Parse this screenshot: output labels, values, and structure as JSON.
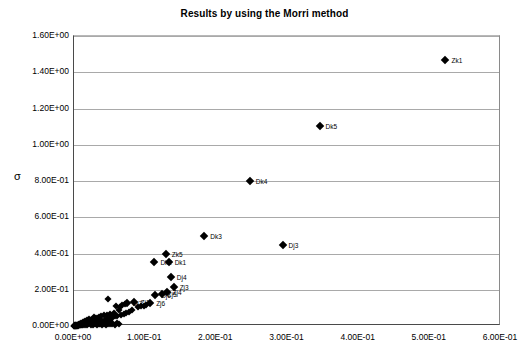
{
  "chart_data": {
    "type": "scatter",
    "title": "Results by using the Morri method",
    "xlabel": "",
    "ylabel": "σ",
    "xlim": [
      0.0,
      0.6
    ],
    "ylim": [
      0.0,
      1.6
    ],
    "grid": "horizontal",
    "legend": "none",
    "marker": "filled-diamond",
    "marker_color": "#000000",
    "x_ticks": [
      "0.00E+00",
      "1.00E-01",
      "2.00E-01",
      "3.00E-01",
      "4.00E-01",
      "5.00E-01",
      "6.00E-01"
    ],
    "x_tick_values": [
      0.0,
      0.1,
      0.2,
      0.3,
      0.4,
      0.5,
      0.6
    ],
    "y_ticks": [
      "0.00E+00",
      "2.00E-01",
      "4.00E-01",
      "6.00E-01",
      "8.00E-01",
      "1.00E+00",
      "1.20E+00",
      "1.40E+00",
      "1.60E+00"
    ],
    "y_tick_values": [
      0.0,
      0.2,
      0.4,
      0.6,
      0.8,
      1.0,
      1.2,
      1.4,
      1.6
    ],
    "labeled_points": [
      {
        "label": "Zk1",
        "x": 0.522,
        "y": 1.468
      },
      {
        "label": "Dk5",
        "x": 0.345,
        "y": 1.105
      },
      {
        "label": "Dk4",
        "x": 0.247,
        "y": 0.8
      },
      {
        "label": "Dk3",
        "x": 0.183,
        "y": 0.497
      },
      {
        "label": "Dj3",
        "x": 0.293,
        "y": 0.448
      },
      {
        "label": "Zk5",
        "x": 0.129,
        "y": 0.4
      },
      {
        "label": "Dk2",
        "x": 0.113,
        "y": 0.355
      },
      {
        "label": "Dk1",
        "x": 0.133,
        "y": 0.353
      },
      {
        "label": "Dj4",
        "x": 0.136,
        "y": 0.272
      },
      {
        "label": "Zj3",
        "x": 0.14,
        "y": 0.217
      },
      {
        "label": "Zj4",
        "x": 0.13,
        "y": 0.19
      },
      {
        "label": "Zj5",
        "x": 0.123,
        "y": 0.175
      },
      {
        "label": "Dj6",
        "x": 0.114,
        "y": 0.17
      },
      {
        "label": "Zj1",
        "x": 0.085,
        "y": 0.135
      },
      {
        "label": "Dj7",
        "x": 0.074,
        "y": 0.128
      },
      {
        "label": "Zj6",
        "x": 0.107,
        "y": 0.128
      }
    ],
    "cluster_points": [
      {
        "x": 0.048,
        "y": 0.148
      },
      {
        "x": 0.059,
        "y": 0.11
      },
      {
        "x": 0.064,
        "y": 0.104
      },
      {
        "x": 0.068,
        "y": 0.118
      },
      {
        "x": 0.071,
        "y": 0.124
      },
      {
        "x": 0.063,
        "y": 0.086
      },
      {
        "x": 0.056,
        "y": 0.074
      },
      {
        "x": 0.051,
        "y": 0.066
      },
      {
        "x": 0.046,
        "y": 0.058
      },
      {
        "x": 0.042,
        "y": 0.062
      },
      {
        "x": 0.038,
        "y": 0.055
      },
      {
        "x": 0.035,
        "y": 0.05
      },
      {
        "x": 0.033,
        "y": 0.046
      },
      {
        "x": 0.03,
        "y": 0.042
      },
      {
        "x": 0.028,
        "y": 0.048
      },
      {
        "x": 0.026,
        "y": 0.038
      },
      {
        "x": 0.024,
        "y": 0.034
      },
      {
        "x": 0.022,
        "y": 0.03
      },
      {
        "x": 0.021,
        "y": 0.04
      },
      {
        "x": 0.02,
        "y": 0.026
      },
      {
        "x": 0.019,
        "y": 0.022
      },
      {
        "x": 0.018,
        "y": 0.032
      },
      {
        "x": 0.017,
        "y": 0.018
      },
      {
        "x": 0.016,
        "y": 0.028
      },
      {
        "x": 0.015,
        "y": 0.014
      },
      {
        "x": 0.014,
        "y": 0.024
      },
      {
        "x": 0.013,
        "y": 0.01
      },
      {
        "x": 0.012,
        "y": 0.02
      },
      {
        "x": 0.011,
        "y": 0.008
      },
      {
        "x": 0.01,
        "y": 0.016
      },
      {
        "x": 0.0095,
        "y": 0.006
      },
      {
        "x": 0.009,
        "y": 0.012
      },
      {
        "x": 0.0085,
        "y": 0.005
      },
      {
        "x": 0.008,
        "y": 0.01
      },
      {
        "x": 0.0075,
        "y": 0.004
      },
      {
        "x": 0.007,
        "y": 0.009
      },
      {
        "x": 0.0065,
        "y": 0.003
      },
      {
        "x": 0.006,
        "y": 0.008
      },
      {
        "x": 0.0055,
        "y": 0.0025
      },
      {
        "x": 0.005,
        "y": 0.007
      },
      {
        "x": 0.0045,
        "y": 0.002
      },
      {
        "x": 0.004,
        "y": 0.006
      },
      {
        "x": 0.0035,
        "y": 0.0015
      },
      {
        "x": 0.003,
        "y": 0.005
      },
      {
        "x": 0.0025,
        "y": 0.001
      },
      {
        "x": 0.002,
        "y": 0.004
      },
      {
        "x": 0.0015,
        "y": 0.0008
      },
      {
        "x": 0.001,
        "y": 0.003
      },
      {
        "x": 0.0008,
        "y": 0.0005
      },
      {
        "x": 0.0005,
        "y": 0.002
      },
      {
        "x": 0.0003,
        "y": 0.001
      },
      {
        "x": 0.026,
        "y": 0.012
      },
      {
        "x": 0.029,
        "y": 0.016
      },
      {
        "x": 0.032,
        "y": 0.02
      },
      {
        "x": 0.035,
        "y": 0.012
      },
      {
        "x": 0.038,
        "y": 0.018
      },
      {
        "x": 0.041,
        "y": 0.022
      },
      {
        "x": 0.044,
        "y": 0.014
      },
      {
        "x": 0.047,
        "y": 0.02
      },
      {
        "x": 0.05,
        "y": 0.026
      },
      {
        "x": 0.053,
        "y": 0.018
      },
      {
        "x": 0.022,
        "y": 0.014
      },
      {
        "x": 0.024,
        "y": 0.008
      },
      {
        "x": 0.027,
        "y": 0.006
      },
      {
        "x": 0.03,
        "y": 0.009
      },
      {
        "x": 0.033,
        "y": 0.007
      },
      {
        "x": 0.036,
        "y": 0.01
      },
      {
        "x": 0.039,
        "y": 0.006
      },
      {
        "x": 0.042,
        "y": 0.011
      },
      {
        "x": 0.045,
        "y": 0.008
      },
      {
        "x": 0.048,
        "y": 0.013
      },
      {
        "x": 0.051,
        "y": 0.009
      },
      {
        "x": 0.054,
        "y": 0.012
      },
      {
        "x": 0.057,
        "y": 0.007
      },
      {
        "x": 0.06,
        "y": 0.014
      },
      {
        "x": 0.063,
        "y": 0.01
      },
      {
        "x": 0.018,
        "y": 0.008
      },
      {
        "x": 0.015,
        "y": 0.005
      },
      {
        "x": 0.012,
        "y": 0.006
      },
      {
        "x": 0.009,
        "y": 0.004
      },
      {
        "x": 0.006,
        "y": 0.003
      },
      {
        "x": 0.02,
        "y": 0.011
      },
      {
        "x": 0.023,
        "y": 0.019
      },
      {
        "x": 0.025,
        "y": 0.023
      },
      {
        "x": 0.031,
        "y": 0.027
      },
      {
        "x": 0.034,
        "y": 0.031
      },
      {
        "x": 0.037,
        "y": 0.035
      },
      {
        "x": 0.04,
        "y": 0.029
      },
      {
        "x": 0.043,
        "y": 0.033
      },
      {
        "x": 0.046,
        "y": 0.037
      },
      {
        "x": 0.049,
        "y": 0.041
      },
      {
        "x": 0.052,
        "y": 0.045
      },
      {
        "x": 0.055,
        "y": 0.049
      },
      {
        "x": 0.058,
        "y": 0.053
      },
      {
        "x": 0.061,
        "y": 0.057
      },
      {
        "x": 0.066,
        "y": 0.062
      },
      {
        "x": 0.07,
        "y": 0.068
      },
      {
        "x": 0.073,
        "y": 0.074
      },
      {
        "x": 0.077,
        "y": 0.08
      },
      {
        "x": 0.081,
        "y": 0.088
      },
      {
        "x": 0.09,
        "y": 0.104
      },
      {
        "x": 0.094,
        "y": 0.108
      },
      {
        "x": 0.098,
        "y": 0.112
      },
      {
        "x": 0.101,
        "y": 0.118
      }
    ]
  }
}
